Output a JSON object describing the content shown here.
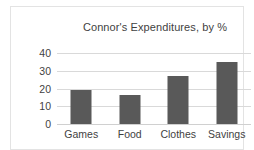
{
  "chart_data": {
    "type": "bar",
    "title": "Connor's Expenditures, by %",
    "categories": [
      "Games",
      "Food",
      "Clothes",
      "Savings"
    ],
    "values": [
      19,
      16.5,
      27,
      35
    ],
    "xlabel": "",
    "ylabel": "",
    "ylim": [
      0,
      40
    ],
    "yticks": [
      0,
      10,
      20,
      30,
      40
    ],
    "ytick_labels": [
      "0",
      "10",
      "20",
      "30",
      "40"
    ],
    "grid": true,
    "legend": false,
    "bar_color": "#595959",
    "gridline_color": "#d9d9d9",
    "text_color": "#3f3f3f",
    "border_color": "#e3e3e3",
    "background": "#ffffff"
  }
}
